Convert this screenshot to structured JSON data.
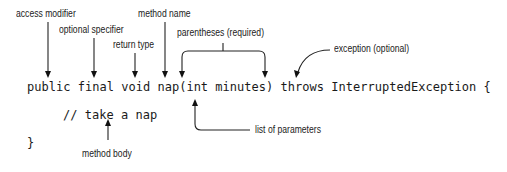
{
  "labels": {
    "access_modifier": "access modifier",
    "optional_specifier": "optional specifier",
    "return_type": "return type",
    "method_name": "method name",
    "parentheses": "parentheses (required)",
    "exception": "exception (optional)",
    "list_of_parameters": "list of parameters",
    "method_body": "method body"
  },
  "code": {
    "line1": "public final void nap(int minutes) throws InterruptedException {",
    "line2": "// take a nap",
    "line3": "}"
  }
}
